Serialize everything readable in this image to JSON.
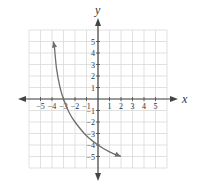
{
  "chart_data": {
    "type": "line",
    "title": "",
    "xlabel": "x",
    "ylabel": "y",
    "xlim": [
      -6,
      6
    ],
    "ylim": [
      -6,
      6
    ],
    "grid": true,
    "x_ticks": [
      -5,
      -4,
      -3,
      -2,
      -1,
      1,
      2,
      3,
      4,
      5
    ],
    "y_ticks": [
      5,
      4,
      3,
      2,
      1,
      -1,
      -2,
      -3,
      -4,
      -5
    ],
    "series": [
      {
        "name": "curve",
        "description": "decreasing logarithmic-shaped curve with arrows at both ends, vertical asymptote near x = -4",
        "x": [
          -3.9,
          -3.8,
          -3.6,
          -3.3,
          -3.0,
          -2.5,
          -2.0,
          -1.0,
          0.0,
          1.0,
          2.0
        ],
        "y": [
          5.0,
          4.6,
          2.6,
          1.0,
          0.0,
          -1.2,
          -2.0,
          -3.2,
          -4.0,
          -4.6,
          -5.0
        ],
        "color": "#6e6e6e"
      }
    ],
    "annotations": []
  },
  "colors": {
    "grid": "#d9d9d9",
    "axis": "#444444",
    "curve": "#6e6e6e"
  }
}
